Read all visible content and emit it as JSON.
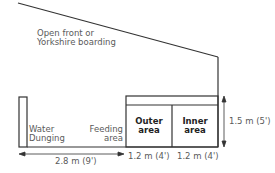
{
  "diagram": {
    "labels": {
      "roof_note_line1": "Open front or",
      "roof_note_line2": "Yorkshire boarding",
      "water": "Water",
      "dunging": "Dunging",
      "feeding_line1": "Feeding",
      "feeding_line2": "area",
      "outer_line1": "Outer",
      "outer_line2": "area",
      "inner_line1": "Inner",
      "inner_line2": "area"
    },
    "dimensions": {
      "run_length": "2.8 m (9')",
      "outer_width": "1.2 m (4')",
      "inner_width": "1.2 m (4')",
      "kennel_height": "1.5 m (5')"
    },
    "colors": {
      "line": "#333333",
      "text": "#5a5a5a"
    }
  }
}
